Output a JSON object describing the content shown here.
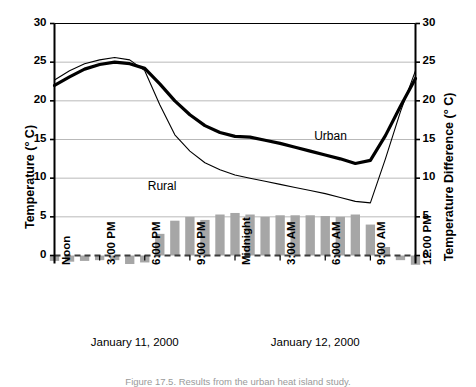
{
  "chart_data": {
    "type": "line",
    "title": "",
    "subtitle": "",
    "ylabel_left": "Temperature (° C)",
    "ylabel_right": "Temperature Difference (° C)",
    "xlabel": "",
    "ylim": [
      0,
      30
    ],
    "yticks": [
      0,
      5,
      10,
      15,
      20,
      25,
      30
    ],
    "ylim_right": [
      0,
      30
    ],
    "yticks_right": [
      0,
      5,
      10,
      15,
      20,
      25,
      30
    ],
    "grid": true,
    "legend_position": "inline-annotation",
    "x": [
      "12:00 PM",
      "1:00 PM",
      "2:00 PM",
      "3:00 PM",
      "4:00 PM",
      "5:00 PM",
      "6:00 PM",
      "7:00 PM",
      "8:00 PM",
      "9:00 PM",
      "10:00 PM",
      "11:00 PM",
      "Midnight",
      "1:00 AM",
      "2:00 AM",
      "3:00 AM",
      "4:00 AM",
      "5:00 AM",
      "6:00 AM",
      "7:00 AM",
      "8:00 AM",
      "9:00 AM",
      "10:00 AM",
      "11:00 AM",
      "12:00 PM"
    ],
    "xtick_labels": [
      "Noon",
      "3:00 PM",
      "6:00 PM",
      "9:00 PM",
      "Midnight",
      "3:00 AM",
      "6:00 AM",
      "9:00 AM",
      "12:00 PM"
    ],
    "xtick_indices": [
      0,
      3,
      6,
      9,
      12,
      15,
      18,
      21,
      24
    ],
    "day_labels": [
      "January 11, 2000",
      "January 12, 2000"
    ],
    "series": [
      {
        "name": "Urban",
        "style": "thick-black-line",
        "color": "#000000",
        "axis": "left",
        "label_x_index": 17,
        "values": [
          22.0,
          23.1,
          24.1,
          24.7,
          25.0,
          24.8,
          24.2,
          22.2,
          20.0,
          18.2,
          16.8,
          15.9,
          15.4,
          15.3,
          14.9,
          14.5,
          14.0,
          13.5,
          13.0,
          12.5,
          11.9,
          12.3,
          15.5,
          19.3,
          22.9
        ]
      },
      {
        "name": "Rural",
        "style": "thin-black-line",
        "color": "#000000",
        "axis": "left",
        "label_x_index": 8,
        "values": [
          22.7,
          23.9,
          24.8,
          25.3,
          25.6,
          25.3,
          23.9,
          19.5,
          15.6,
          13.5,
          12.0,
          11.1,
          10.4,
          10.0,
          9.6,
          9.2,
          8.8,
          8.4,
          8.0,
          7.5,
          7.0,
          6.8,
          12.5,
          18.6,
          23.9
        ]
      },
      {
        "name": "Temperature Difference (Urban − Rural)",
        "style": "gray-bars",
        "color": "#a6a6a6",
        "axis": "right",
        "values": [
          -0.7,
          -0.8,
          -0.7,
          -0.6,
          -0.6,
          -1.1,
          -0.9,
          2.8,
          4.5,
          5.0,
          4.6,
          5.3,
          5.5,
          5.3,
          5.0,
          5.2,
          5.2,
          5.2,
          5.1,
          5.0,
          5.3,
          4.0,
          1.1,
          -0.6,
          -1.2
        ]
      }
    ]
  },
  "caption": "Figure 17.5. Results from the urban heat island study.",
  "colors": {
    "bar": "#a6a6a6",
    "grid": "#b9b9b9",
    "axis": "#000000",
    "zero_line": "#3c3c3c"
  }
}
